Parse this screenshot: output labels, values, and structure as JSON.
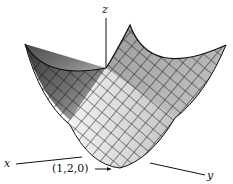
{
  "diagram": {
    "type": "3d-surface-paraboloid",
    "axes": {
      "x_label": "x",
      "y_label": "y",
      "z_label": "z"
    },
    "annotation": {
      "text": "(1,2,0)",
      "arrow": "→"
    },
    "colors": {
      "ink": "#111111",
      "surface_light": "#e8e8e8",
      "surface_mid": "#a8a8a8",
      "surface_dark": "#404040"
    }
  }
}
